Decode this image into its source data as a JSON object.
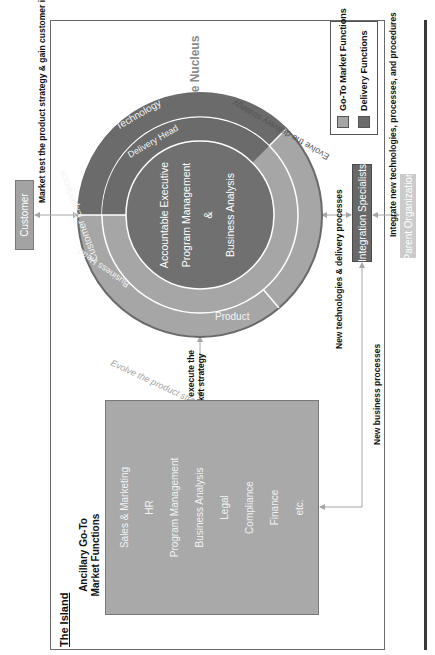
{
  "colors": {
    "go_to_market": "#a6a6a6",
    "delivery": "#6b6b6b",
    "core": "#707070",
    "customer_box": "#a3a3a3",
    "integration_box": "#686868",
    "parent_box": "#cbcbcb",
    "island_box": "#a9a9a9"
  },
  "customer": {
    "label": "Customer"
  },
  "market_test_label": "Market test the product strategy & gain customer insights",
  "nucleus": {
    "title": "The Nucleus",
    "core_lines": [
      "Accountable Executive",
      "Program Management",
      "&",
      "Business Analysis"
    ],
    "middle_ring": {
      "go_to_market": "Business Head",
      "delivery": "Delivery Head"
    },
    "outer_ring": {
      "customer_experience": "Customer Experience",
      "product": "Product",
      "technology": "Technology"
    },
    "arc_labels": {
      "product_strategy": "Evolve the product strategy",
      "delivery_strategy": "Evolve the delivery strategy"
    }
  },
  "legend": {
    "items": [
      {
        "label": "Go-To Market Functions",
        "color": "#a6a6a6"
      },
      {
        "label": "Delivery Functions",
        "color": "#6b6b6b"
      }
    ]
  },
  "integration": {
    "label": "Integration Specialists"
  },
  "parent": {
    "label": "Parent Organization"
  },
  "integrate_label": "Integrate new technologies, processes, and procedures",
  "new_tech_label": "New technologies & delivery processes",
  "new_business_label": "New business processes",
  "create_execute_label": [
    "Create and execute the",
    "Go-To Market strategy"
  ],
  "island": {
    "title": "The Island",
    "box_title": [
      "Ancillary Go-To",
      "Market Functions"
    ],
    "items": [
      "Sales & Marketing",
      "HR",
      "Program Management",
      "Business Analysis",
      "Legal",
      "Compliance",
      "Finance",
      "etc."
    ]
  }
}
